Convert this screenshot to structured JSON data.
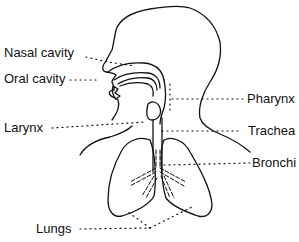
{
  "diagram": {
    "type": "anatomy",
    "labels": [
      {
        "id": "nasal-cavity",
        "text": "Nasal cavity",
        "side": "left"
      },
      {
        "id": "oral-cavity",
        "text": "Oral cavity",
        "side": "left"
      },
      {
        "id": "larynx",
        "text": "Larynx",
        "side": "left"
      },
      {
        "id": "lungs",
        "text": "Lungs",
        "side": "left"
      },
      {
        "id": "pharynx",
        "text": "Pharynx",
        "side": "right"
      },
      {
        "id": "trachea",
        "text": "Trachea",
        "side": "right"
      },
      {
        "id": "bronchi",
        "text": "Bronchi",
        "side": "right"
      }
    ],
    "colors": {
      "line": "#111111",
      "background": "#ffffff"
    }
  }
}
